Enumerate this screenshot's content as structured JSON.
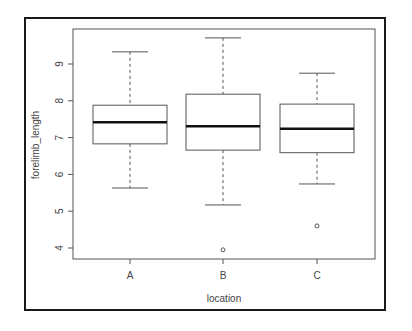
{
  "chart_data": {
    "type": "box",
    "title": "",
    "xlabel": "location",
    "ylabel": "forelimb_length",
    "categories": [
      "A",
      "B",
      "C"
    ],
    "yticks": [
      4,
      5,
      6,
      7,
      8,
      9
    ],
    "ylim": [
      3.75,
      9.9
    ],
    "grid": false,
    "legend": null,
    "boxes": [
      {
        "name": "A",
        "whisker_low": 5.63,
        "q1": 6.83,
        "median": 7.42,
        "q3": 7.88,
        "whisker_high": 9.33,
        "outliers": []
      },
      {
        "name": "B",
        "whisker_low": 5.17,
        "q1": 6.66,
        "median": 7.31,
        "q3": 8.18,
        "whisker_high": 9.71,
        "outliers": [
          3.95
        ]
      },
      {
        "name": "C",
        "whisker_low": 5.74,
        "q1": 6.59,
        "median": 7.24,
        "q3": 7.91,
        "whisker_high": 8.75,
        "outliers": [
          4.6
        ]
      }
    ]
  },
  "labels": {
    "xlabel": "location",
    "ylabel": "forelimb_length"
  }
}
